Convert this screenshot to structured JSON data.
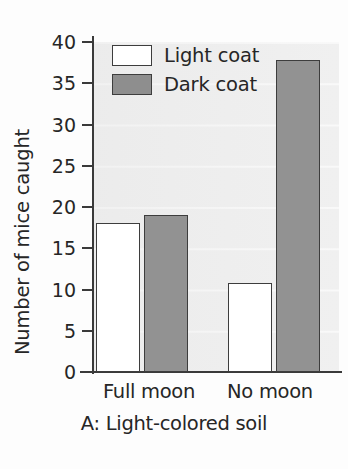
{
  "chart_data": {
    "type": "bar",
    "title": "",
    "caption": "A: Light-colored soil",
    "xlabel": "",
    "ylabel": "Number of mice caught",
    "categories": [
      "Full moon",
      "No moon"
    ],
    "series": [
      {
        "name": "Light coat",
        "values": [
          18.1,
          10.8
        ],
        "color": "#ffffff"
      },
      {
        "name": "Dark coat",
        "values": [
          19.0,
          37.8
        ],
        "color": "#929292"
      }
    ],
    "ylim": [
      0,
      40
    ],
    "yticks": [
      0,
      5,
      10,
      15,
      20,
      25,
      30,
      35,
      40
    ],
    "ytick_labels": [
      "0",
      "5",
      "10",
      "15",
      "20",
      "25",
      "30",
      "35",
      "40"
    ],
    "grid": true,
    "legend_position": "top-left",
    "legend_entries": [
      "Light coat",
      "Dark coat"
    ]
  },
  "colors": {
    "light_coat": "#ffffff",
    "dark_coat": "#929292",
    "axis": "#3a3a3a",
    "text": "#262626",
    "plot_background": "#f0f0f0"
  }
}
